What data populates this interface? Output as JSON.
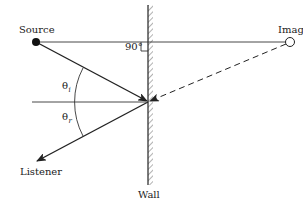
{
  "diagram": {
    "type": "sound-reflection-image-source",
    "labels": {
      "source": "Source",
      "image": "Image",
      "listener": "Listener",
      "wall": "Wall",
      "right_angle": "90°",
      "theta_i_base": "θ",
      "theta_i_sub": "i",
      "theta_r_base": "θ",
      "theta_r_sub": "r"
    },
    "elements": [
      "source-point",
      "image-point",
      "wall",
      "incident-ray",
      "reflected-ray",
      "image-ray-dashed",
      "normal-line",
      "source-image-line",
      "angle-arc"
    ],
    "colors": {
      "stroke": "#222222",
      "hatch": "#555555",
      "background": "#ffffff"
    }
  }
}
